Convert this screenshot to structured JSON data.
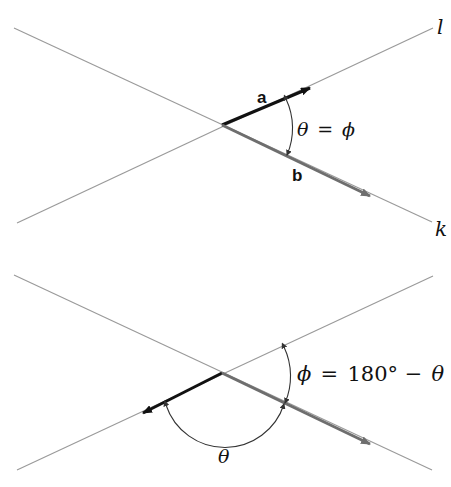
{
  "header": {
    "fragment": ""
  },
  "top_diagram": {
    "line_l_label": "l",
    "line_k_label": "k",
    "vector_a_label": "a",
    "vector_b_label": "b",
    "angle_label_theta": "θ",
    "angle_label_eq": "=",
    "angle_label_phi": "ϕ"
  },
  "bottom_diagram": {
    "phi_label": "ϕ",
    "eq": "=",
    "value": "180° −",
    "theta_after": "θ",
    "theta_label": "θ"
  },
  "colors": {
    "thin_line": "#9a9a9a",
    "vector_a": "#111111",
    "vector_b": "#6e6e6e",
    "arc": "#333333"
  }
}
